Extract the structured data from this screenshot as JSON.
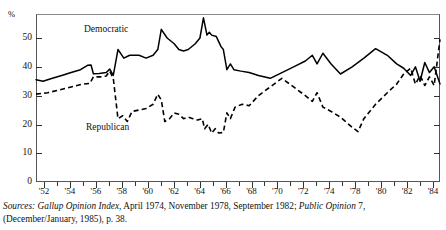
{
  "chart_data": {
    "type": "line",
    "title": "",
    "xlabel": "",
    "ylabel": "%",
    "ylim": [
      0,
      57
    ],
    "xlim": [
      1952,
      1984
    ],
    "grid": false,
    "legend": "inline-annotations",
    "y_ticks": [
      0,
      10,
      20,
      30,
      40,
      50
    ],
    "y_tick_labels": [
      "0",
      "10",
      "20",
      "30",
      "40",
      "50"
    ],
    "x_tick_labels": [
      "'52",
      "'54",
      "'56",
      "'58",
      "'60",
      "'62",
      "'64",
      "'66",
      "'68",
      "'70",
      "'72",
      "'74",
      "'78",
      "'80",
      "'82",
      "'84"
    ],
    "x_tick_values": [
      1952,
      1954,
      1956,
      1958,
      1960,
      1962,
      1964,
      1966,
      1968,
      1970,
      1972,
      1974,
      1978,
      1980,
      1982,
      1984
    ],
    "series": [
      {
        "name": "Democratic",
        "style": "solid",
        "color": "#000000",
        "points": [
          [
            1952.0,
            35.5
          ],
          [
            1952.6,
            35.0
          ],
          [
            1953.4,
            36.0
          ],
          [
            1954.2,
            37.0
          ],
          [
            1955.0,
            38.0
          ],
          [
            1955.8,
            39.0
          ],
          [
            1956.4,
            40.5
          ],
          [
            1956.7,
            40.6
          ],
          [
            1956.9,
            37.6
          ],
          [
            1957.4,
            37.7
          ],
          [
            1958.0,
            38.0
          ],
          [
            1958.3,
            39.2
          ],
          [
            1958.6,
            37.0
          ],
          [
            1959.0,
            46.0
          ],
          [
            1959.5,
            43.0
          ],
          [
            1960.0,
            44.0
          ],
          [
            1960.8,
            44.0
          ],
          [
            1961.4,
            43.0
          ],
          [
            1962.0,
            44.0
          ],
          [
            1962.4,
            46.0
          ],
          [
            1962.7,
            53.0
          ],
          [
            1963.2,
            50.0
          ],
          [
            1963.8,
            48.0
          ],
          [
            1964.2,
            46.0
          ],
          [
            1964.6,
            45.5
          ],
          [
            1965.0,
            46.0
          ],
          [
            1965.6,
            48.0
          ],
          [
            1966.0,
            50.0
          ],
          [
            1966.3,
            57.0
          ],
          [
            1966.6,
            51.0
          ],
          [
            1966.8,
            52.0
          ],
          [
            1967.0,
            51.0
          ],
          [
            1967.4,
            50.5
          ],
          [
            1967.8,
            47.0
          ],
          [
            1968.0,
            46.0
          ],
          [
            1968.3,
            39.0
          ],
          [
            1968.6,
            41.0
          ],
          [
            1968.9,
            39.0
          ],
          [
            1969.5,
            38.5
          ],
          [
            1970.2,
            38.0
          ],
          [
            1971.0,
            37.0
          ],
          [
            1972.0,
            36.0
          ],
          [
            1973.0,
            38.0
          ],
          [
            1974.0,
            40.0
          ],
          [
            1975.0,
            42.0
          ],
          [
            1975.6,
            44.0
          ],
          [
            1976.0,
            41.0
          ],
          [
            1976.5,
            44.7
          ],
          [
            1977.2,
            41.0
          ],
          [
            1978.0,
            37.5
          ],
          [
            1979.0,
            40.0
          ],
          [
            1980.0,
            43.0
          ],
          [
            1981.0,
            46.3
          ],
          [
            1982.0,
            44.0
          ],
          [
            1982.8,
            41.0
          ],
          [
            1983.4,
            39.5
          ],
          [
            1984.0,
            37.0
          ],
          [
            1984.4,
            40.0
          ],
          [
            1984.8,
            35.0
          ],
          [
            1985.2,
            41.5
          ],
          [
            1985.6,
            38.0
          ],
          [
            1986.0,
            40.0
          ],
          [
            1986.5,
            34.0
          ]
        ]
      },
      {
        "name": "Republican",
        "style": "dashed",
        "color": "#000000",
        "points": [
          [
            1952.0,
            30.5
          ],
          [
            1953.0,
            31.0
          ],
          [
            1954.0,
            32.0
          ],
          [
            1955.0,
            33.0
          ],
          [
            1956.0,
            34.0
          ],
          [
            1956.6,
            34.2
          ],
          [
            1956.9,
            36.5
          ],
          [
            1957.5,
            36.5
          ],
          [
            1958.0,
            36.8
          ],
          [
            1958.3,
            38.5
          ],
          [
            1958.6,
            36.0
          ],
          [
            1959.0,
            22.0
          ],
          [
            1959.4,
            23.0
          ],
          [
            1959.8,
            21.0
          ],
          [
            1960.2,
            24.5
          ],
          [
            1960.8,
            25.0
          ],
          [
            1961.4,
            25.5
          ],
          [
            1962.0,
            27.0
          ],
          [
            1962.4,
            30.5
          ],
          [
            1962.7,
            28.5
          ],
          [
            1963.0,
            21.0
          ],
          [
            1963.4,
            22.0
          ],
          [
            1963.8,
            24.0
          ],
          [
            1964.2,
            23.5
          ],
          [
            1964.6,
            22.0
          ],
          [
            1965.0,
            22.5
          ],
          [
            1965.4,
            22.0
          ],
          [
            1965.8,
            21.5
          ],
          [
            1966.2,
            22.0
          ],
          [
            1966.4,
            18.5
          ],
          [
            1966.7,
            20.0
          ],
          [
            1967.0,
            17.0
          ],
          [
            1967.3,
            18.5
          ],
          [
            1967.6,
            17.0
          ],
          [
            1968.0,
            17.2
          ],
          [
            1968.3,
            24.0
          ],
          [
            1968.6,
            22.0
          ],
          [
            1969.0,
            26.0
          ],
          [
            1969.6,
            27.0
          ],
          [
            1970.2,
            26.5
          ],
          [
            1971.0,
            30.0
          ],
          [
            1972.0,
            33.0
          ],
          [
            1973.0,
            36.0
          ],
          [
            1974.0,
            33.0
          ],
          [
            1975.0,
            30.0
          ],
          [
            1975.6,
            28.0
          ],
          [
            1976.0,
            31.0
          ],
          [
            1976.5,
            26.0
          ],
          [
            1977.2,
            24.5
          ],
          [
            1978.0,
            22.5
          ],
          [
            1979.0,
            19.0
          ],
          [
            1979.5,
            17.5
          ],
          [
            1980.0,
            22.0
          ],
          [
            1981.0,
            27.0
          ],
          [
            1982.0,
            31.0
          ],
          [
            1982.8,
            34.0
          ],
          [
            1983.4,
            37.5
          ],
          [
            1984.0,
            39.5
          ],
          [
            1984.4,
            34.0
          ],
          [
            1984.8,
            37.0
          ],
          [
            1985.2,
            33.5
          ],
          [
            1985.6,
            36.5
          ],
          [
            1986.0,
            33.5
          ],
          [
            1986.5,
            49.5
          ]
        ]
      }
    ],
    "annotations": [
      {
        "text": "Democratic",
        "x": 1957.8,
        "y": 50.0
      },
      {
        "text": "Republican",
        "x": 1957.9,
        "y": 20.8
      }
    ]
  },
  "axis": {
    "y_unit_label": "%",
    "y_labels": [
      "50",
      "40",
      "30",
      "20",
      "10",
      "0"
    ],
    "x_labels": [
      "'52",
      "'54",
      "'56",
      "'58",
      "'60",
      "'62",
      "'64",
      "'66",
      "'68",
      "'70",
      "'72",
      "'74",
      "'78",
      "'80",
      "'82",
      "'84"
    ]
  },
  "labels": {
    "democratic": "Democratic",
    "republican": "Republican"
  },
  "clipped_title": "",
  "source": {
    "prefix": "Sources:",
    "work1": "Gallup Opinion Index",
    "mid": ", April 1974, November 1978, September 1982; ",
    "work2": "Public Opinion",
    "suffix": " 7,",
    "line2": "(December/January, 1985), p. 38."
  }
}
